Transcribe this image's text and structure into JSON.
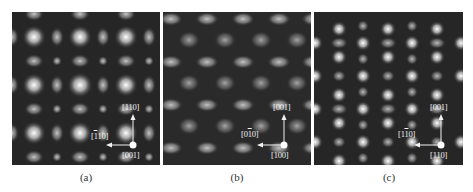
{
  "figure": {
    "panels": [
      {
        "id": "a",
        "caption": "(a)",
        "description": "simulated HRTEM lattice image, square pattern of bright spots",
        "axes": {
          "vertical": {
            "pre": "[",
            "bar": "",
            "digits": "110",
            "post": "]"
          },
          "horizontal": {
            "pre": "[",
            "bar": "1",
            "digits": "10",
            "post": "]"
          },
          "zone": {
            "pre": "[",
            "bar": "",
            "digits": "001",
            "post": "]"
          }
        }
      },
      {
        "id": "b",
        "caption": "(b)",
        "description": "simulated HRTEM lattice image, hexagonal/diamond pattern",
        "axes": {
          "vertical": {
            "pre": "[",
            "bar": "",
            "digits": "001",
            "post": "]"
          },
          "horizontal": {
            "pre": "[0",
            "bar": "1",
            "digits": "0",
            "post": "]"
          },
          "zone": {
            "pre": "[",
            "bar": "",
            "digits": "100",
            "post": "]"
          }
        }
      },
      {
        "id": "c",
        "caption": "(c)",
        "description": "simulated HRTEM lattice image, columnar rectangular pattern",
        "axes": {
          "vertical": {
            "pre": "[",
            "bar": "",
            "digits": "001",
            "post": "]"
          },
          "horizontal": {
            "pre": "[1",
            "bar": "1",
            "digits": "0",
            "post": "]"
          },
          "zone": {
            "pre": "[",
            "bar": "",
            "digits": "110",
            "post": "]"
          }
        }
      }
    ],
    "colors": {
      "background": "#262626",
      "spot": "#ffffff",
      "arrow": "#f2f2f2"
    }
  }
}
